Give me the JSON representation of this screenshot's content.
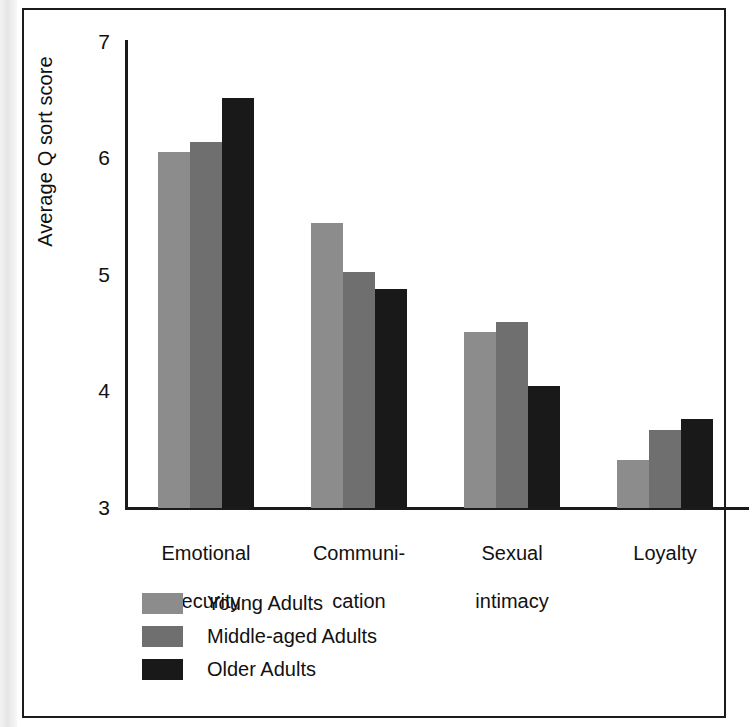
{
  "chart_data": {
    "type": "bar",
    "title": "",
    "xlabel": "",
    "ylabel": "Average Q sort score",
    "ylim": [
      3,
      7
    ],
    "yticks": [
      "7",
      "6",
      "5",
      "4",
      "3"
    ],
    "grid": false,
    "legend_position": "bottom-left",
    "categories": [
      "Emotional\nsecurity",
      "Communi-\ncation",
      "Sexual\nintimacy",
      "Loyalty"
    ],
    "series": [
      {
        "name": "Young Adults",
        "color": "#8c8c8c",
        "values": [
          6.06,
          5.45,
          4.51,
          3.41
        ]
      },
      {
        "name": "Middle-aged Adults",
        "color": "#6f6f6f",
        "values": [
          6.14,
          5.03,
          4.6,
          3.67
        ]
      },
      {
        "name": "Older Adults",
        "color": "#191919",
        "values": [
          6.52,
          4.88,
          4.05,
          3.76
        ]
      }
    ]
  },
  "axis": {
    "y_title": "Average Q sort score",
    "ticks": {
      "t7": "7",
      "t6": "6",
      "t5": "5",
      "t4": "4",
      "t3": "3"
    }
  },
  "categories": {
    "c0_line1": "Emotional",
    "c0_line2": "security",
    "c1_line1": "Communi-",
    "c1_line2": "cation",
    "c2_line1": "Sexual",
    "c2_line2": "intimacy",
    "c3_line1": "Loyalty",
    "c3_line2": ""
  },
  "legend": {
    "items": [
      {
        "label": "Young Adults",
        "color": "#8c8c8c"
      },
      {
        "label": "Middle-aged Adults",
        "color": "#6f6f6f"
      },
      {
        "label": "Older Adults",
        "color": "#191919"
      }
    ]
  }
}
